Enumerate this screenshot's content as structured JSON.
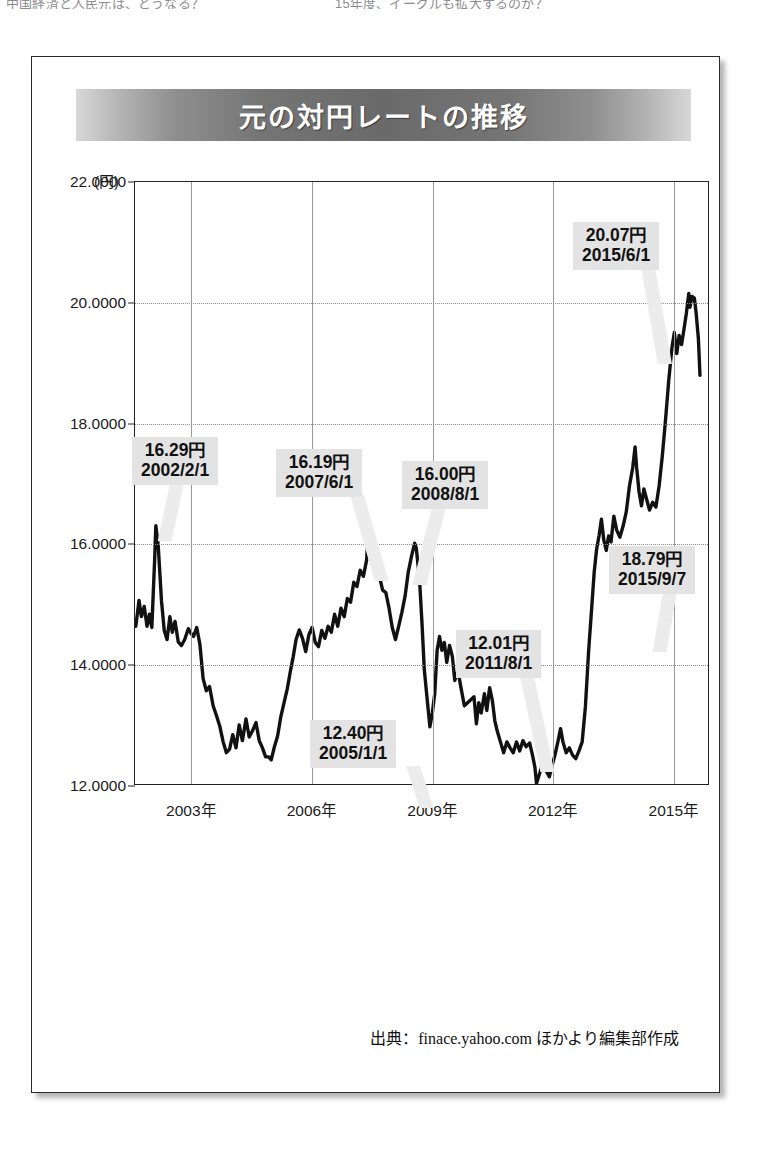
{
  "page": {
    "top_fragment_left": "中国経済と人民元は、どうなる？",
    "top_fragment_right": "15年度、イーグルも拡大するのか？"
  },
  "figure": {
    "title": "元の対円レートの推移",
    "unit_label": "(円)",
    "source": "出典：finace.yahoo.com ほかより編集部作成"
  },
  "chart_data": {
    "type": "line",
    "title": "元の対円レートの推移",
    "xlabel": "",
    "ylabel": "(円)",
    "ylim": [
      12.0,
      22.0
    ],
    "ytick_labels": [
      "22.0000",
      "20.0000",
      "18.0000",
      "16.0000",
      "14.0000",
      "12.0000"
    ],
    "ytick_values": [
      22.0,
      20.0,
      18.0,
      16.0,
      14.0,
      12.0
    ],
    "xtick_labels": [
      "2003年",
      "2006年",
      "2009年",
      "2012年",
      "2015年"
    ],
    "xtick_values": [
      2003.0,
      2006.0,
      2009.0,
      2012.0,
      2015.0
    ],
    "xlim": [
      2001.6,
      2015.9
    ],
    "grid": "dotted-horizontal-solid-vertical",
    "legend": "none",
    "series": [
      {
        "name": "元の対円レート",
        "color": "#111111",
        "points": [
          [
            2001.62,
            14.62
          ],
          [
            2001.7,
            15.05
          ],
          [
            2001.76,
            14.78
          ],
          [
            2001.83,
            14.95
          ],
          [
            2001.9,
            14.62
          ],
          [
            2001.96,
            14.82
          ],
          [
            2002.02,
            14.6
          ],
          [
            2002.09,
            15.72
          ],
          [
            2002.12,
            16.29
          ],
          [
            2002.18,
            15.95
          ],
          [
            2002.26,
            15.05
          ],
          [
            2002.33,
            14.55
          ],
          [
            2002.4,
            14.4
          ],
          [
            2002.47,
            14.78
          ],
          [
            2002.53,
            14.52
          ],
          [
            2002.6,
            14.7
          ],
          [
            2002.68,
            14.36
          ],
          [
            2002.76,
            14.3
          ],
          [
            2002.84,
            14.4
          ],
          [
            2002.93,
            14.58
          ],
          [
            2003.0,
            14.5
          ],
          [
            2003.06,
            14.45
          ],
          [
            2003.14,
            14.6
          ],
          [
            2003.22,
            14.32
          ],
          [
            2003.3,
            13.75
          ],
          [
            2003.38,
            13.55
          ],
          [
            2003.46,
            13.62
          ],
          [
            2003.55,
            13.3
          ],
          [
            2003.64,
            13.12
          ],
          [
            2003.72,
            12.95
          ],
          [
            2003.8,
            12.7
          ],
          [
            2003.88,
            12.52
          ],
          [
            2003.96,
            12.58
          ],
          [
            2004.04,
            12.82
          ],
          [
            2004.12,
            12.6
          ],
          [
            2004.2,
            12.98
          ],
          [
            2004.28,
            12.72
          ],
          [
            2004.37,
            13.08
          ],
          [
            2004.45,
            12.78
          ],
          [
            2004.53,
            12.88
          ],
          [
            2004.62,
            13.02
          ],
          [
            2004.7,
            12.72
          ],
          [
            2004.78,
            12.6
          ],
          [
            2004.86,
            12.45
          ],
          [
            2004.94,
            12.45
          ],
          [
            2005.0,
            12.4
          ],
          [
            2005.08,
            12.62
          ],
          [
            2005.16,
            12.8
          ],
          [
            2005.24,
            13.12
          ],
          [
            2005.32,
            13.35
          ],
          [
            2005.4,
            13.58
          ],
          [
            2005.48,
            13.88
          ],
          [
            2005.55,
            14.12
          ],
          [
            2005.62,
            14.4
          ],
          [
            2005.7,
            14.56
          ],
          [
            2005.78,
            14.42
          ],
          [
            2005.86,
            14.2
          ],
          [
            2005.94,
            14.48
          ],
          [
            2006.02,
            14.6
          ],
          [
            2006.1,
            14.35
          ],
          [
            2006.18,
            14.28
          ],
          [
            2006.26,
            14.55
          ],
          [
            2006.34,
            14.42
          ],
          [
            2006.42,
            14.62
          ],
          [
            2006.5,
            14.52
          ],
          [
            2006.58,
            14.82
          ],
          [
            2006.66,
            14.62
          ],
          [
            2006.74,
            14.92
          ],
          [
            2006.82,
            14.78
          ],
          [
            2006.9,
            15.08
          ],
          [
            2006.98,
            15.02
          ],
          [
            2007.06,
            15.35
          ],
          [
            2007.14,
            15.28
          ],
          [
            2007.22,
            15.55
          ],
          [
            2007.3,
            15.45
          ],
          [
            2007.38,
            15.72
          ],
          [
            2007.42,
            16.19
          ],
          [
            2007.5,
            15.8
          ],
          [
            2007.58,
            15.62
          ],
          [
            2007.64,
            15.48
          ],
          [
            2007.7,
            15.45
          ],
          [
            2007.78,
            15.22
          ],
          [
            2007.86,
            15.18
          ],
          [
            2007.94,
            14.92
          ],
          [
            2008.02,
            14.6
          ],
          [
            2008.1,
            14.4
          ],
          [
            2008.18,
            14.62
          ],
          [
            2008.26,
            14.85
          ],
          [
            2008.34,
            15.12
          ],
          [
            2008.42,
            15.52
          ],
          [
            2008.5,
            15.78
          ],
          [
            2008.58,
            16.0
          ],
          [
            2008.62,
            15.92
          ],
          [
            2008.7,
            15.4
          ],
          [
            2008.76,
            14.7
          ],
          [
            2008.82,
            13.9
          ],
          [
            2008.9,
            13.35
          ],
          [
            2008.96,
            12.95
          ],
          [
            2009.02,
            13.18
          ],
          [
            2009.08,
            13.5
          ],
          [
            2009.14,
            14.22
          ],
          [
            2009.2,
            14.45
          ],
          [
            2009.26,
            14.22
          ],
          [
            2009.32,
            14.35
          ],
          [
            2009.38,
            14.02
          ],
          [
            2009.45,
            14.3
          ],
          [
            2009.52,
            14.12
          ],
          [
            2009.58,
            13.72
          ],
          [
            2009.66,
            13.88
          ],
          [
            2009.74,
            13.58
          ],
          [
            2009.82,
            13.3
          ],
          [
            2009.9,
            13.35
          ],
          [
            2009.98,
            13.4
          ],
          [
            2010.06,
            13.45
          ],
          [
            2010.12,
            13.0
          ],
          [
            2010.18,
            13.35
          ],
          [
            2010.24,
            13.18
          ],
          [
            2010.32,
            13.5
          ],
          [
            2010.38,
            13.22
          ],
          [
            2010.45,
            13.6
          ],
          [
            2010.52,
            13.38
          ],
          [
            2010.58,
            13.05
          ],
          [
            2010.64,
            12.88
          ],
          [
            2010.72,
            12.7
          ],
          [
            2010.8,
            12.52
          ],
          [
            2010.88,
            12.7
          ],
          [
            2010.96,
            12.6
          ],
          [
            2011.04,
            12.52
          ],
          [
            2011.12,
            12.7
          ],
          [
            2011.2,
            12.55
          ],
          [
            2011.28,
            12.72
          ],
          [
            2011.36,
            12.62
          ],
          [
            2011.45,
            12.68
          ],
          [
            2011.52,
            12.48
          ],
          [
            2011.58,
            12.28
          ],
          [
            2011.62,
            12.01
          ],
          [
            2011.7,
            12.18
          ],
          [
            2011.78,
            12.38
          ],
          [
            2011.86,
            12.22
          ],
          [
            2011.94,
            12.12
          ],
          [
            2012.0,
            12.28
          ],
          [
            2012.08,
            12.48
          ],
          [
            2012.16,
            12.72
          ],
          [
            2012.22,
            12.92
          ],
          [
            2012.28,
            12.7
          ],
          [
            2012.36,
            12.52
          ],
          [
            2012.44,
            12.6
          ],
          [
            2012.52,
            12.48
          ],
          [
            2012.6,
            12.42
          ],
          [
            2012.68,
            12.55
          ],
          [
            2012.76,
            12.7
          ],
          [
            2012.84,
            13.28
          ],
          [
            2012.92,
            14.2
          ],
          [
            2013.0,
            14.95
          ],
          [
            2013.06,
            15.52
          ],
          [
            2013.12,
            15.9
          ],
          [
            2013.18,
            16.12
          ],
          [
            2013.24,
            16.4
          ],
          [
            2013.3,
            16.05
          ],
          [
            2013.36,
            15.88
          ],
          [
            2013.42,
            16.12
          ],
          [
            2013.48,
            16.02
          ],
          [
            2013.55,
            16.45
          ],
          [
            2013.62,
            16.22
          ],
          [
            2013.7,
            16.1
          ],
          [
            2013.78,
            16.28
          ],
          [
            2013.86,
            16.52
          ],
          [
            2013.94,
            16.95
          ],
          [
            2014.02,
            17.25
          ],
          [
            2014.08,
            17.6
          ],
          [
            2014.12,
            17.25
          ],
          [
            2014.18,
            16.85
          ],
          [
            2014.24,
            16.62
          ],
          [
            2014.3,
            16.9
          ],
          [
            2014.38,
            16.7
          ],
          [
            2014.44,
            16.55
          ],
          [
            2014.52,
            16.68
          ],
          [
            2014.6,
            16.6
          ],
          [
            2014.68,
            16.95
          ],
          [
            2014.76,
            17.45
          ],
          [
            2014.84,
            18.05
          ],
          [
            2014.92,
            18.7
          ],
          [
            2015.0,
            19.25
          ],
          [
            2015.06,
            19.5
          ],
          [
            2015.12,
            19.15
          ],
          [
            2015.18,
            19.45
          ],
          [
            2015.24,
            19.3
          ],
          [
            2015.3,
            19.55
          ],
          [
            2015.36,
            19.82
          ],
          [
            2015.42,
            20.15
          ],
          [
            2015.45,
            19.92
          ],
          [
            2015.5,
            20.1
          ],
          [
            2015.56,
            20.07
          ],
          [
            2015.6,
            19.85
          ],
          [
            2015.66,
            19.4
          ],
          [
            2015.7,
            18.79
          ]
        ]
      }
    ],
    "annotations": [
      {
        "id": "a-2002",
        "value": "16.29円",
        "date": "2002/2/1",
        "x": 2002.12,
        "y": 16.29
      },
      {
        "id": "a-2005",
        "value": "12.40円",
        "date": "2005/1/1",
        "x": 2005.0,
        "y": 12.4
      },
      {
        "id": "a-2007",
        "value": "16.19円",
        "date": "2007/6/1",
        "x": 2007.42,
        "y": 16.19
      },
      {
        "id": "a-2008",
        "value": "16.00円",
        "date": "2008/8/1",
        "x": 2008.58,
        "y": 16.0
      },
      {
        "id": "a-2011",
        "value": "12.01円",
        "date": "2011/8/1",
        "x": 2011.62,
        "y": 12.01
      },
      {
        "id": "a-2015-06",
        "value": "20.07円",
        "date": "2015/6/1",
        "x": 2015.42,
        "y": 20.07
      },
      {
        "id": "a-2015-09",
        "value": "18.79円",
        "date": "2015/9/7",
        "x": 2015.7,
        "y": 18.79
      }
    ]
  }
}
